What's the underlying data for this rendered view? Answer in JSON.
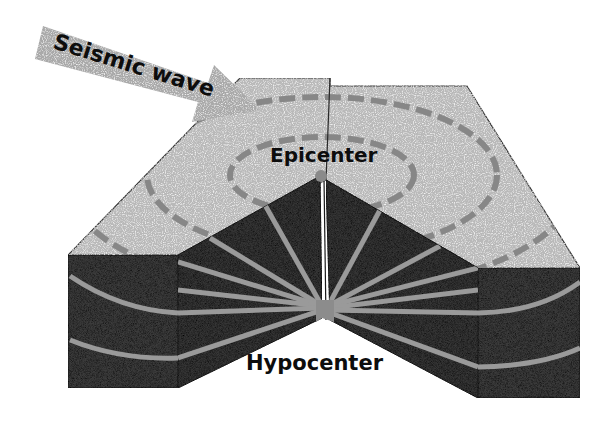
{
  "diagram": {
    "type": "earthquake cross-section block diagram",
    "labels": {
      "arrow": "Seismic wave",
      "epicenter": "Epicenter",
      "hypocenter": "Hypocenter"
    },
    "colors": {
      "background": "#ffffff",
      "surface": "#b9b9b9",
      "surface_dash": "#8a8a8a",
      "rock_face": "#3a3a3a",
      "rock_face_dark": "#2e2e2e",
      "wave_ray": "#9a9a9a",
      "arrow": "#a8a8a8",
      "text": "#0d0d0d",
      "edge": "#2a2a2a"
    },
    "elements": [
      {
        "name": "seismic-wave-arrow",
        "description": "Gray arrow pointing toward the ground surface"
      },
      {
        "name": "ground-surface",
        "description": "Light gray top surface with concentric dashed rings around epicenter"
      },
      {
        "name": "fault-line",
        "description": "Vertical line splitting the block at the center"
      },
      {
        "name": "cutaway-faces",
        "description": "Dark speckled rock faces with radiating wave rays"
      },
      {
        "name": "hypocenter-point",
        "description": "Origin point at the bottom of the cutaway wedge"
      }
    ]
  }
}
